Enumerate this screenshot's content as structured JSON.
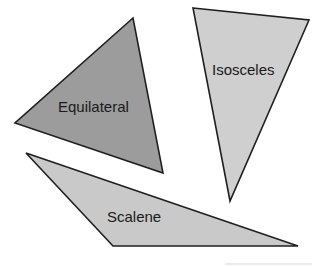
{
  "diagram": {
    "colors": {
      "stroke": "#1f1f1f",
      "equilateral_fill": "#9c9c9c",
      "isosceles_fill": "#cfcfcf",
      "scalene_fill": "#c9c9c9",
      "background": "#ffffff"
    },
    "triangles": [
      {
        "name": "equilateral",
        "label": "Equilateral",
        "points": "133,18 15,123 163,173",
        "label_x": 58,
        "label_y": 112
      },
      {
        "name": "isosceles",
        "label": "Isosceles",
        "points": "193,8 309,20 230,201",
        "label_x": 212,
        "label_y": 75
      },
      {
        "name": "scalene",
        "label": "Scalene",
        "points": "26,153 113,246 298,246",
        "label_x": 107,
        "label_y": 222
      }
    ]
  }
}
